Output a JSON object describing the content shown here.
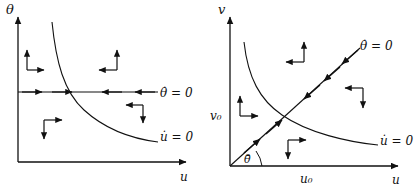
{
  "figure": {
    "type": "phase-portrait-pair",
    "background_color": "#ffffff",
    "stroke_color": "#111111"
  },
  "left_plot": {
    "name": "phase-plane-theta-u",
    "axes": {
      "y_label": "θ",
      "x_label": "u"
    },
    "nullclines": [
      {
        "id": "theta-dot-zero",
        "label": "θ̇ = 0",
        "shape": "horizontal-line"
      },
      {
        "id": "u-dot-zero",
        "label": "u̇ = 0",
        "shape": "hyperbola-decreasing"
      }
    ],
    "direction_arrows": [
      {
        "region": "upper-left",
        "horizontal": "right",
        "vertical": "up"
      },
      {
        "region": "upper-right",
        "horizontal": "left",
        "vertical": "up"
      },
      {
        "region": "lower-right",
        "horizontal": "left",
        "vertical": "down"
      },
      {
        "region": "lower-left",
        "horizontal": "right",
        "vertical": "down"
      }
    ],
    "flow_on_theta_nullcline": [
      {
        "direction": "right"
      },
      {
        "direction": "right"
      },
      {
        "direction": "left"
      },
      {
        "direction": "left"
      }
    ]
  },
  "right_plot": {
    "name": "phase-plane-v-u",
    "axes": {
      "y_label": "v",
      "x_label": "u"
    },
    "tick_labels": {
      "y_tick": "v₀",
      "x_tick": "u₀"
    },
    "angle_label": "θ̄",
    "nullclines": [
      {
        "id": "theta-dot-zero",
        "label": "θ̇ = 0",
        "shape": "ray-through-origin"
      },
      {
        "id": "u-dot-zero",
        "label": "u̇ = 0",
        "shape": "hyperbola-decreasing"
      }
    ],
    "direction_arrows": [
      {
        "region": "upper-left",
        "horizontal": "left",
        "vertical": "up"
      },
      {
        "region": "upper-right",
        "horizontal": "left",
        "vertical": "down"
      },
      {
        "region": "mid-left",
        "horizontal": "right",
        "vertical": "up"
      },
      {
        "region": "lower-mid",
        "horizontal": "right",
        "vertical": "down"
      }
    ],
    "flow_on_ray": [
      {
        "direction": "up-right"
      },
      {
        "direction": "up-right"
      },
      {
        "direction": "down-left"
      },
      {
        "direction": "down-left"
      },
      {
        "direction": "down-left"
      }
    ]
  }
}
